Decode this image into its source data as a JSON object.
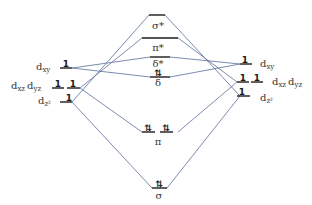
{
  "diagram": {
    "left_atom": {
      "orbitals": [
        {
          "label": "d",
          "sub": "xy",
          "electrons": "1"
        },
        {
          "label": "d",
          "sub": "xz",
          "label2": "d",
          "sub2": "yz",
          "electrons": [
            "1",
            "1"
          ]
        },
        {
          "label": "d",
          "sub": "z²",
          "electrons": "1"
        }
      ]
    },
    "right_atom": {
      "orbitals": [
        {
          "label": "d",
          "sub": "xy",
          "electrons": "1"
        },
        {
          "label": "d",
          "sub": "xz",
          "label2": "d",
          "sub2": "yz",
          "electrons": [
            "1",
            "1"
          ]
        },
        {
          "label": "d",
          "sub": "z²",
          "electrons": "1"
        }
      ]
    },
    "molecular_orbitals": [
      {
        "label": "σ*",
        "electrons": ""
      },
      {
        "label": "π*",
        "electrons": ""
      },
      {
        "label": "δ*",
        "electrons": ""
      },
      {
        "label": "δ",
        "electrons": "⇅"
      },
      {
        "label": "π",
        "electrons": [
          "⇅",
          "⇅"
        ]
      },
      {
        "label": "σ",
        "electrons": "⇅"
      }
    ],
    "colors": {
      "levels": "#1a1a1a",
      "connectors": "#5a6f9a"
    }
  }
}
